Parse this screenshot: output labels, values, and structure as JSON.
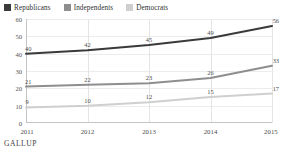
{
  "legend": {
    "position": "top-left",
    "items": [
      {
        "label": "Republicans",
        "color": "#3a3a3a"
      },
      {
        "label": "Independents",
        "color": "#8e8e8e"
      },
      {
        "label": "Democrats",
        "color": "#cfcfcf"
      }
    ]
  },
  "footer": {
    "source": "GALLUP"
  },
  "chart_data": {
    "type": "line",
    "title": "",
    "subtitle": "",
    "xlabel": "",
    "ylabel": "",
    "x": [
      "2011",
      "2012",
      "2013",
      "2014",
      "2015"
    ],
    "categories": [
      "2011",
      "2012",
      "2013",
      "2014",
      "2015"
    ],
    "xtick_labels": [
      "2011",
      "2012",
      "2013",
      "2014",
      "2015"
    ],
    "ytick_labels": [
      "0",
      "10",
      "20",
      "30",
      "40",
      "50",
      "60"
    ],
    "yticks": [
      0,
      10,
      20,
      30,
      40,
      50,
      60
    ],
    "ylim": [
      0,
      60
    ],
    "grid": {
      "horizontal": true,
      "vertical": true
    },
    "legend_position": "top-left",
    "series": [
      {
        "name": "Republicans",
        "color": "#3a3a3a",
        "values": [
          40,
          42,
          45,
          49,
          56
        ],
        "labels": [
          "40",
          "42",
          "45",
          "49",
          "56"
        ]
      },
      {
        "name": "Independents",
        "color": "#8e8e8e",
        "values": [
          21,
          22,
          23,
          26,
          33
        ],
        "labels": [
          "21",
          "22",
          "23",
          "26",
          "33"
        ]
      },
      {
        "name": "Democrats",
        "color": "#cfcfcf",
        "values": [
          9,
          10,
          12,
          15,
          17
        ],
        "labels": [
          "9",
          "10",
          "12",
          "15",
          "17"
        ]
      }
    ]
  }
}
